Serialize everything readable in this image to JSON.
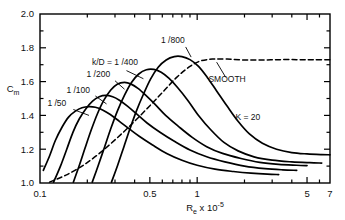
{
  "chart_data": {
    "type": "line",
    "title": "",
    "xlabel": "Re x 10-5",
    "xlabel_base": "R",
    "xlabel_base_sub": "e",
    "xlabel_mult": "x 10",
    "xlabel_exp": "-5",
    "ylabel": "Cm",
    "ylabel_base": "C",
    "ylabel_sub": "m",
    "xscale": "log",
    "yscale": "linear",
    "xlim": [
      0.1,
      7
    ],
    "ylim": [
      1.0,
      2.0
    ],
    "grid": false,
    "legend_position": "inline-annotations",
    "xticks_major": [
      0.1,
      0.5,
      1,
      5,
      7
    ],
    "xtick_labels": [
      "0.1",
      "0.5",
      "1",
      "5",
      "7"
    ],
    "xticks_minor": [
      0.2,
      0.3,
      0.4,
      0.6,
      0.7,
      0.8,
      0.9,
      2,
      3,
      4,
      6
    ],
    "yticks_major": [
      1.0,
      1.2,
      1.4,
      1.6,
      1.8,
      2.0
    ],
    "ytick_labels": [
      "1.0",
      "1.2",
      "1.4",
      "1.6",
      "1.8",
      "2.0"
    ],
    "yticks_minor": [
      1.1,
      1.3,
      1.5,
      1.7,
      1.9
    ],
    "annotations": [
      {
        "text": "k/D = 1 /400",
        "x": 0.3,
        "y": 1.7
      },
      {
        "text": "1 /800",
        "x": 0.7,
        "y": 1.83
      },
      {
        "text": "1 /200",
        "x": 0.235,
        "y": 1.625
      },
      {
        "text": "1 /100",
        "x": 0.175,
        "y": 1.535
      },
      {
        "text": "1 /50",
        "x": 0.128,
        "y": 1.455
      },
      {
        "text": "SMOOTH",
        "x": 1.55,
        "y": 1.6
      },
      {
        "text": "K = 20",
        "x": 2.1,
        "y": 1.37
      }
    ],
    "series": [
      {
        "name": "1 /50",
        "label": "1 /50",
        "style": "solid",
        "points": [
          [
            0.105,
            1.075
          ],
          [
            0.115,
            1.16
          ],
          [
            0.125,
            1.25
          ],
          [
            0.138,
            1.33
          ],
          [
            0.152,
            1.39
          ],
          [
            0.168,
            1.425
          ],
          [
            0.185,
            1.445
          ],
          [
            0.205,
            1.452
          ],
          [
            0.225,
            1.448
          ],
          [
            0.25,
            1.432
          ],
          [
            0.28,
            1.405
          ],
          [
            0.32,
            1.365
          ],
          [
            0.37,
            1.32
          ],
          [
            0.43,
            1.275
          ],
          [
            0.52,
            1.225
          ],
          [
            0.64,
            1.175
          ],
          [
            0.8,
            1.135
          ],
          [
            1.0,
            1.105
          ],
          [
            1.3,
            1.082
          ],
          [
            1.7,
            1.068
          ],
          [
            2.2,
            1.058
          ],
          [
            2.8,
            1.052
          ],
          [
            3.3,
            1.05
          ]
        ]
      },
      {
        "name": "1 /100",
        "label": "1 /100",
        "style": "solid",
        "points": [
          [
            0.122,
            1.005
          ],
          [
            0.135,
            1.1
          ],
          [
            0.148,
            1.2
          ],
          [
            0.162,
            1.3
          ],
          [
            0.178,
            1.38
          ],
          [
            0.196,
            1.44
          ],
          [
            0.216,
            1.485
          ],
          [
            0.238,
            1.51
          ],
          [
            0.262,
            1.518
          ],
          [
            0.29,
            1.51
          ],
          [
            0.32,
            1.49
          ],
          [
            0.36,
            1.455
          ],
          [
            0.41,
            1.41
          ],
          [
            0.48,
            1.355
          ],
          [
            0.58,
            1.3
          ],
          [
            0.72,
            1.245
          ],
          [
            0.9,
            1.195
          ],
          [
            1.15,
            1.155
          ],
          [
            1.5,
            1.125
          ],
          [
            2.0,
            1.1
          ],
          [
            2.7,
            1.085
          ],
          [
            3.5,
            1.078
          ],
          [
            4.3,
            1.075
          ]
        ]
      },
      {
        "name": "1 /200",
        "label": "1 /200",
        "style": "solid",
        "points": [
          [
            0.163,
            1.005
          ],
          [
            0.178,
            1.105
          ],
          [
            0.194,
            1.21
          ],
          [
            0.212,
            1.315
          ],
          [
            0.232,
            1.41
          ],
          [
            0.255,
            1.49
          ],
          [
            0.282,
            1.55
          ],
          [
            0.31,
            1.585
          ],
          [
            0.345,
            1.595
          ],
          [
            0.38,
            1.585
          ],
          [
            0.42,
            1.56
          ],
          [
            0.47,
            1.52
          ],
          [
            0.54,
            1.465
          ],
          [
            0.63,
            1.4
          ],
          [
            0.76,
            1.335
          ],
          [
            0.93,
            1.27
          ],
          [
            1.15,
            1.215
          ],
          [
            1.45,
            1.175
          ],
          [
            1.9,
            1.145
          ],
          [
            2.5,
            1.122
          ],
          [
            3.3,
            1.11
          ],
          [
            4.3,
            1.105
          ],
          [
            5.0,
            1.103
          ]
        ]
      },
      {
        "name": "1 /400",
        "label": "k/D = 1 /400",
        "style": "solid",
        "points": [
          [
            0.215,
            1.005
          ],
          [
            0.235,
            1.105
          ],
          [
            0.258,
            1.215
          ],
          [
            0.283,
            1.325
          ],
          [
            0.312,
            1.43
          ],
          [
            0.345,
            1.52
          ],
          [
            0.382,
            1.595
          ],
          [
            0.425,
            1.645
          ],
          [
            0.475,
            1.67
          ],
          [
            0.53,
            1.672
          ],
          [
            0.59,
            1.655
          ],
          [
            0.66,
            1.62
          ],
          [
            0.75,
            1.565
          ],
          [
            0.87,
            1.49
          ],
          [
            1.02,
            1.4
          ],
          [
            1.22,
            1.315
          ],
          [
            1.48,
            1.24
          ],
          [
            1.82,
            1.19
          ],
          [
            2.3,
            1.155
          ],
          [
            3.0,
            1.135
          ],
          [
            4.0,
            1.125
          ],
          [
            5.2,
            1.12
          ],
          [
            6.2,
            1.118
          ]
        ]
      },
      {
        "name": "1 /800",
        "label": "1 /800",
        "style": "solid",
        "points": [
          [
            0.285,
            1.005
          ],
          [
            0.312,
            1.105
          ],
          [
            0.342,
            1.215
          ],
          [
            0.375,
            1.325
          ],
          [
            0.412,
            1.43
          ],
          [
            0.455,
            1.525
          ],
          [
            0.505,
            1.615
          ],
          [
            0.565,
            1.685
          ],
          [
            0.635,
            1.728
          ],
          [
            0.715,
            1.748
          ],
          [
            0.8,
            1.748
          ],
          [
            0.9,
            1.73
          ],
          [
            1.02,
            1.69
          ],
          [
            1.16,
            1.625
          ],
          [
            1.33,
            1.545
          ],
          [
            1.55,
            1.455
          ],
          [
            1.82,
            1.365
          ],
          [
            2.15,
            1.29
          ],
          [
            2.6,
            1.235
          ],
          [
            3.2,
            1.2
          ],
          [
            4.0,
            1.18
          ],
          [
            5.0,
            1.172
          ],
          [
            6.2,
            1.168
          ],
          [
            7.0,
            1.167
          ]
        ]
      },
      {
        "name": "SMOOTH",
        "label": "SMOOTH",
        "style": "dashed",
        "points": [
          [
            0.115,
            1.005
          ],
          [
            0.145,
            1.045
          ],
          [
            0.185,
            1.1
          ],
          [
            0.235,
            1.17
          ],
          [
            0.3,
            1.255
          ],
          [
            0.38,
            1.345
          ],
          [
            0.48,
            1.44
          ],
          [
            0.6,
            1.535
          ],
          [
            0.74,
            1.625
          ],
          [
            0.9,
            1.69
          ],
          [
            1.05,
            1.722
          ],
          [
            1.25,
            1.733
          ],
          [
            1.55,
            1.733
          ],
          [
            2.0,
            1.728
          ],
          [
            2.6,
            1.728
          ],
          [
            3.4,
            1.73
          ],
          [
            4.4,
            1.73
          ],
          [
            5.5,
            1.73
          ],
          [
            7.0,
            1.73
          ]
        ]
      }
    ],
    "leader_lines": [
      {
        "from": [
          0.355,
          1.665
        ],
        "to": [
          0.455,
          1.617
        ]
      },
      {
        "from": [
          0.845,
          1.805
        ],
        "to": [
          0.915,
          1.745
        ]
      },
      {
        "from": [
          0.3,
          1.605
        ],
        "to": [
          0.345,
          1.555
        ]
      },
      {
        "from": [
          0.225,
          1.515
        ],
        "to": [
          0.265,
          1.468
        ]
      },
      {
        "from": [
          0.163,
          1.435
        ],
        "to": [
          0.205,
          1.4
        ]
      },
      {
        "from": [
          1.52,
          1.625
        ],
        "to": [
          1.33,
          1.715
        ]
      }
    ]
  }
}
